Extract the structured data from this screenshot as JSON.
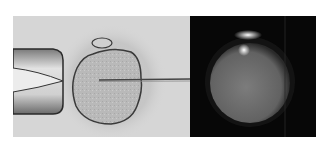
{
  "figure": {
    "panels": [
      {
        "id": "left",
        "description": "Brightfield micrograph: oocyte held by holding pipette (left) with injection micropipette entering from right",
        "colors": {
          "background": "#d6d6d6",
          "cell": "#bdbdbd",
          "outline": "#3a3a3a"
        }
      },
      {
        "id": "right",
        "description": "Fluorescence micrograph of the same oocyte on dark background",
        "colors": {
          "background": "#070707",
          "cell": "#6e6e6e",
          "highlight": "#f2f2f2"
        }
      }
    ]
  }
}
